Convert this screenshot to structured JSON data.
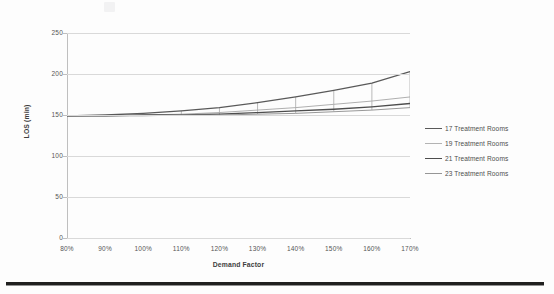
{
  "document": {
    "kind": "scanned-page",
    "background_color": "#fdfdfd",
    "bottom_rule_color": "#20201f"
  },
  "chart_data": {
    "type": "line",
    "title": "",
    "xlabel": "Demand Factor",
    "ylabel": "LOS (min)",
    "x": [
      "80%",
      "90%",
      "100%",
      "110%",
      "120%",
      "130%",
      "140%",
      "150%",
      "160%",
      "170%"
    ],
    "xlim": [
      0,
      9
    ],
    "ylim": [
      0,
      250
    ],
    "yticks": [
      0,
      50,
      100,
      150,
      200,
      250
    ],
    "grid": "horizontal",
    "legend_position": "right",
    "series": [
      {
        "name": "17 Treatment Rooms",
        "color": "#595959",
        "width": 1.3,
        "values": [
          149,
          150,
          152,
          155,
          159,
          165,
          172,
          180,
          189,
          203
        ]
      },
      {
        "name": "19 Treatment Rooms",
        "color": "#a6a6a6",
        "width": 0.9,
        "values": [
          149,
          149,
          150,
          151,
          153,
          156,
          159,
          163,
          167,
          172
        ]
      },
      {
        "name": "21 Treatment Rooms",
        "color": "#4d4d4d",
        "width": 1.3,
        "values": [
          149,
          149,
          150,
          150,
          151,
          153,
          155,
          157,
          160,
          164
        ]
      },
      {
        "name": "23 Treatment Rooms",
        "color": "#8c8c8c",
        "width": 0.9,
        "values": [
          149,
          149,
          149,
          150,
          150,
          151,
          152,
          154,
          156,
          159
        ]
      }
    ],
    "vertical_connectors_at": [
      "110%",
      "120%",
      "130%",
      "140%",
      "150%",
      "160%",
      "170%"
    ]
  },
  "axis": {
    "y_tick_labels": [
      "250",
      "200",
      "150",
      "100",
      "50",
      "0"
    ],
    "x_tick_labels": [
      "80%",
      "90%",
      "100%",
      "110%",
      "120%",
      "130%",
      "140%",
      "150%",
      "160%",
      "170%"
    ],
    "y_title": "LOS (min)",
    "x_title": "Demand Factor"
  },
  "legend": {
    "items": [
      {
        "label": "17 Treatment Rooms",
        "color": "#595959",
        "width": 1.4
      },
      {
        "label": "19 Treatment Rooms",
        "color": "#b3b3b3",
        "width": 0.9
      },
      {
        "label": "21 Treatment Rooms",
        "color": "#4d4d4d",
        "width": 1.5
      },
      {
        "label": "23 Treatment Rooms",
        "color": "#969696",
        "width": 1.0
      }
    ]
  }
}
